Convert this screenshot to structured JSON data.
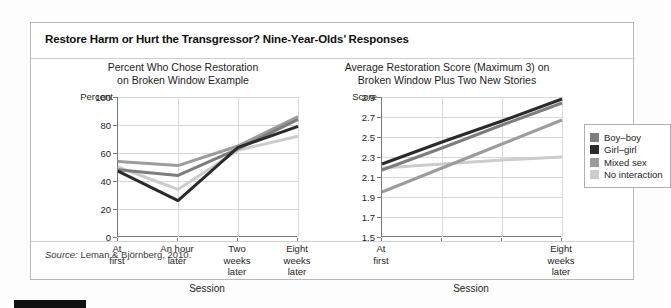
{
  "figure": {
    "title": "Restore Harm or Hurt the Transgressor? Nine-Year-Olds’ Responses",
    "source_label": "Source:",
    "source_text": " Leman & Björnberg, 2010."
  },
  "legend": {
    "items": [
      {
        "label": "Boy–boy",
        "color": "#7d7d7d"
      },
      {
        "label": "Girl–girl",
        "color": "#2b2b2b"
      },
      {
        "label": "Mixed sex",
        "color": "#9c9c9c"
      },
      {
        "label": "No interaction",
        "color": "#cccccc"
      }
    ]
  },
  "chart_data": [
    {
      "id": "left",
      "type": "line",
      "title": "Percent Who Chose Restoration\non Broken Window Example",
      "title_line1": "Percent Who Chose Restoration",
      "title_line2": "on Broken Window Example",
      "xlabel": "Session",
      "ylabel": "Percent",
      "categories": [
        "At\nfirst",
        "An hour\nlater",
        "Two\nweeks\nlater",
        "Eight\nweeks\nlater"
      ],
      "yticks": [
        0,
        20,
        40,
        60,
        80,
        100
      ],
      "ylim": [
        0,
        100
      ],
      "grid": true,
      "legend_position": "right-outside",
      "series": [
        {
          "name": "Boy–boy",
          "color": "#7d7d7d",
          "values": [
            48,
            44,
            63,
            84
          ]
        },
        {
          "name": "Girl–girl",
          "color": "#2b2b2b",
          "values": [
            47,
            26,
            64,
            79
          ]
        },
        {
          "name": "Mixed sex",
          "color": "#9c9c9c",
          "values": [
            54,
            51,
            65,
            86
          ]
        },
        {
          "name": "No interaction",
          "color": "#cccccc",
          "values": [
            50,
            34,
            62,
            72
          ]
        }
      ]
    },
    {
      "id": "right",
      "type": "line",
      "title": "Average Restoration Score (Maximum 3) on\nBroken Window Plus Two New Stories",
      "title_line1": "Average Restoration Score (Maximum 3) on",
      "title_line2": "Broken Window Plus Two New Stories",
      "xlabel": "Session",
      "ylabel": "Score",
      "categories": [
        "At\nfirst",
        "",
        "",
        "Eight\nweeks\nlater"
      ],
      "yticks": [
        1.5,
        1.7,
        1.9,
        2.1,
        2.3,
        2.5,
        2.7,
        2.9
      ],
      "ylim": [
        1.5,
        2.9
      ],
      "grid": true,
      "series": [
        {
          "name": "Boy–boy",
          "color": "#7d7d7d",
          "values": [
            2.17,
            2.39,
            2.62,
            2.84
          ]
        },
        {
          "name": "Girl–girl",
          "color": "#2b2b2b",
          "values": [
            2.23,
            2.45,
            2.66,
            2.88
          ]
        },
        {
          "name": "Mixed sex",
          "color": "#9c9c9c",
          "values": [
            1.95,
            2.19,
            2.43,
            2.67
          ]
        },
        {
          "name": "No interaction",
          "color": "#cccccc",
          "values": [
            2.19,
            2.23,
            2.27,
            2.3
          ]
        }
      ]
    }
  ]
}
